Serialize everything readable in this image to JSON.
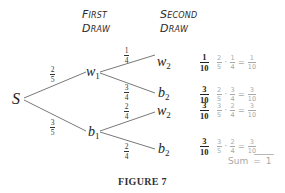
{
  "headers": {
    "first_draw": [
      "First",
      "Draw"
    ],
    "second_draw": [
      "Second",
      "Draw"
    ]
  },
  "nodes": {
    "start": {
      "label": "S"
    },
    "first": [
      {
        "base": "w",
        "sub": "1"
      },
      {
        "base": "b",
        "sub": "1"
      }
    ],
    "second": [
      {
        "base": "w",
        "sub": "2"
      },
      {
        "base": "b",
        "sub": "2"
      },
      {
        "base": "w",
        "sub": "2"
      },
      {
        "base": "b",
        "sub": "2"
      }
    ]
  },
  "branch_probabilities": {
    "s_to_w1": {
      "num": "2",
      "den": "5"
    },
    "s_to_b1": {
      "num": "3",
      "den": "5"
    },
    "w1_to_w2": {
      "num": "1",
      "den": "4"
    },
    "w1_to_b2": {
      "num": "3",
      "den": "4"
    },
    "b1_to_w2": {
      "num": "2",
      "den": "4"
    },
    "b1_to_b2": {
      "num": "2",
      "den": "4"
    }
  },
  "outcomes": [
    {
      "result": {
        "num": "1",
        "den": "10"
      },
      "annotation": {
        "a": {
          "num": "2",
          "den": "5"
        },
        "op": "·",
        "b": {
          "num": "1",
          "den": "4"
        },
        "eq": "=",
        "r": {
          "num": "1",
          "den": "10"
        }
      }
    },
    {
      "result": {
        "num": "3",
        "den": "10"
      },
      "annotation": {
        "a": {
          "num": "2",
          "den": "5"
        },
        "op": "·",
        "b": {
          "num": "3",
          "den": "4"
        },
        "eq": "=",
        "r": {
          "num": "3",
          "den": "10"
        }
      }
    },
    {
      "result": {
        "num": "3",
        "den": "10"
      },
      "annotation": {
        "a": {
          "num": "3",
          "den": "5"
        },
        "op": "·",
        "b": {
          "num": "2",
          "den": "4"
        },
        "eq": "=",
        "r": {
          "num": "3",
          "den": "10"
        }
      }
    },
    {
      "result": {
        "num": "3",
        "den": "10"
      },
      "annotation": {
        "a": {
          "num": "3",
          "den": "5"
        },
        "op": "·",
        "b": {
          "num": "2",
          "den": "4"
        },
        "eq": "=",
        "r": {
          "num": "3",
          "den": "10"
        }
      }
    }
  ],
  "sum": {
    "label": "Sum",
    "eq": "=",
    "value": "1"
  },
  "caption": "FIGURE 7",
  "colors": {
    "line": "#555555",
    "annotation": "#a8a8a8",
    "text": "#222222"
  }
}
